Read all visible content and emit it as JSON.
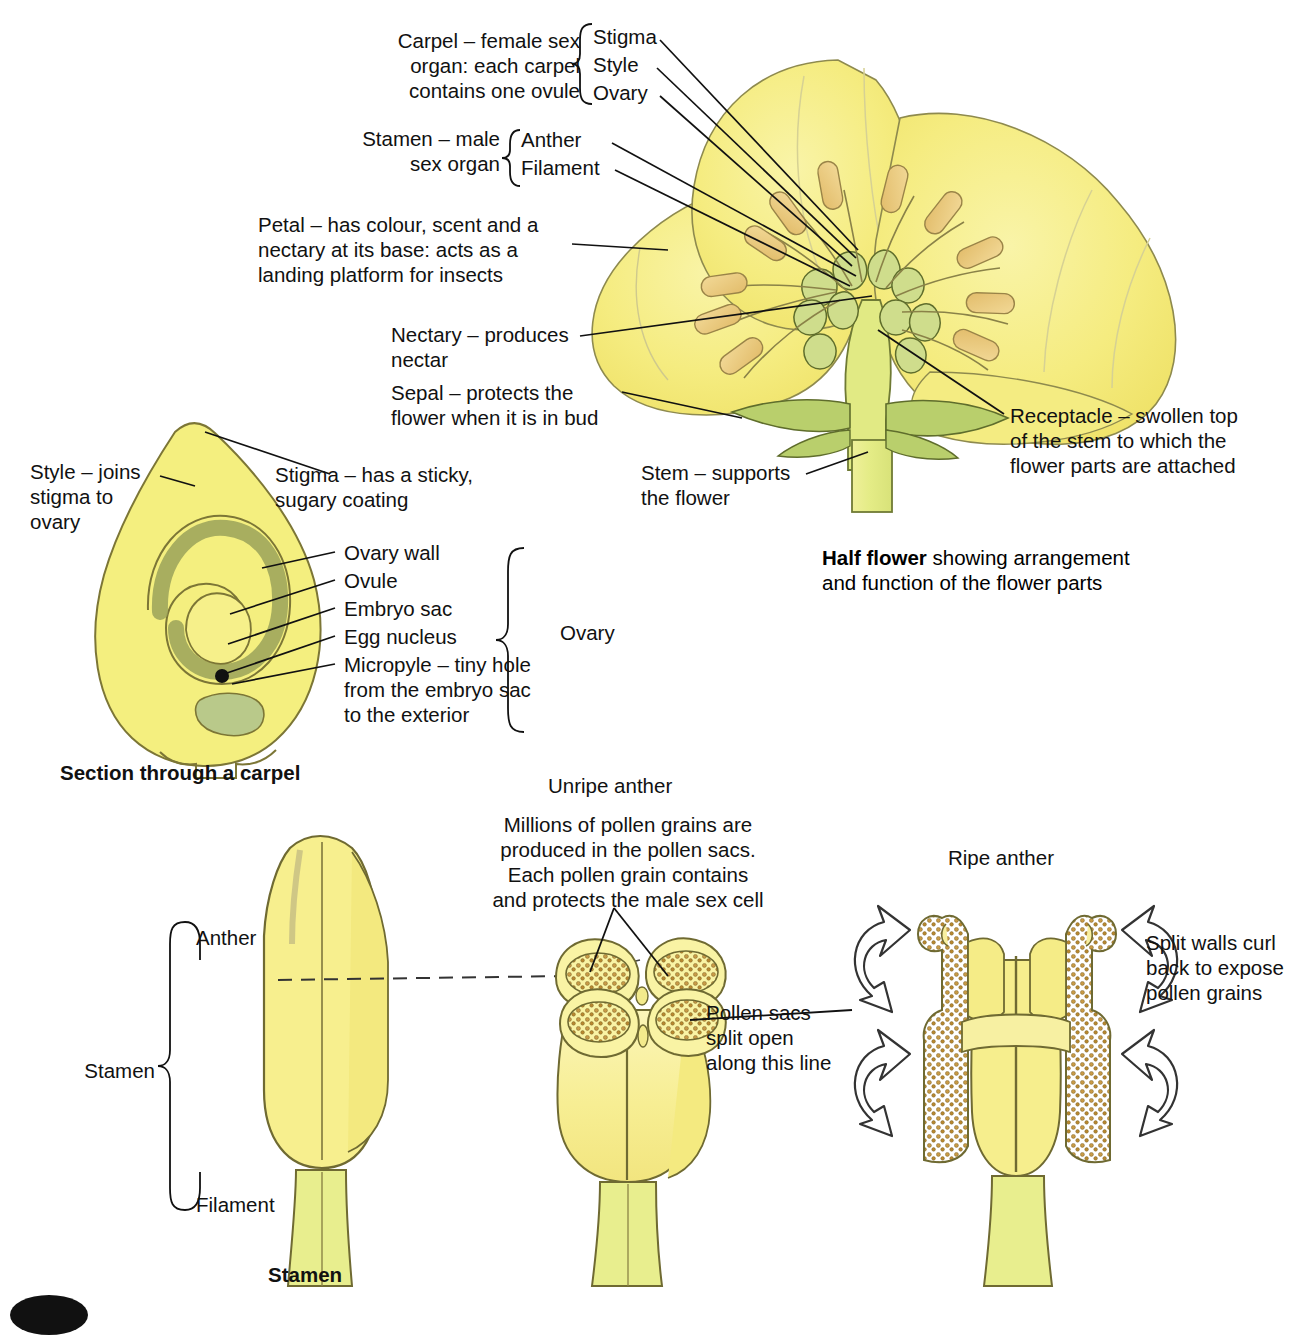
{
  "figure": {
    "palette": {
      "petal_yellow": "#f7f08a",
      "petal_yellow_deep": "#f0e36a",
      "leaf_green": "#c3d67e",
      "sepal_green": "#b7cd6d",
      "anther_tan": "#e8c87a",
      "pollen_brown": "#b98a3c",
      "ink": "#111111",
      "outline": "#6b6535"
    }
  },
  "half_flower": {
    "caption_bold": "Half flower",
    "caption_rest": " showing arrangement",
    "caption_line2": "and function of the flower parts",
    "labels": {
      "carpel": "Carpel – female sex\norgan: each carpel\ncontains one ovule",
      "carpel_parts": [
        "Stigma",
        "Style",
        "Ovary"
      ],
      "stamen": "Stamen – male\nsex organ",
      "stamen_parts": [
        "Anther",
        "Filament"
      ],
      "petal": "Petal – has colour, scent and a\nnectary at its base: acts as a\nlanding platform for insects",
      "nectary": "Nectary – produces\nnectar",
      "sepal": "Sepal – protects the\nflower when it is in bud",
      "stem": "Stem – supports\nthe flower",
      "receptacle": "Receptacle – swollen top\nof the stem to which the\nflower parts are attached"
    }
  },
  "carpel_section": {
    "caption": "Section through a carpel",
    "labels": {
      "style": "Style – joins\nstigma to\novary",
      "stigma": "Stigma – has a sticky,\nsugary coating",
      "ovary_wall": "Ovary wall",
      "ovule": "Ovule",
      "embryo_sac": "Embryo sac",
      "egg_nucleus": "Egg nucleus",
      "micropyle": "Micropyle – tiny hole\nfrom the embryo sac\nto the exterior",
      "brace": "Ovary"
    }
  },
  "stamen_views": {
    "whole": {
      "caption": "Stamen",
      "bracket_label": "Stamen",
      "anther_label": "Anther",
      "filament_label": "Filament"
    },
    "unripe": {
      "title": "Unripe anther",
      "body": "Millions of pollen grains are\nproduced in the pollen sacs.\nEach pollen grain contains\nand protects the male sex cell",
      "pollen_sacs_note": "Pollen sacs\nsplit open\nalong this line"
    },
    "ripe": {
      "title": "Ripe anther",
      "note": "Split walls curl\nback to expose\npollen grains"
    }
  }
}
